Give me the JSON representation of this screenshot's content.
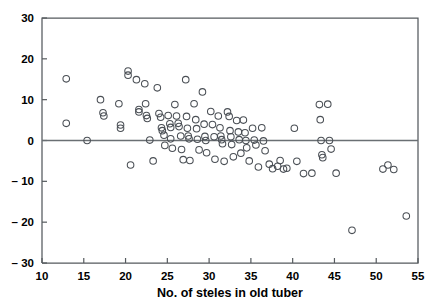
{
  "chart_data": {
    "type": "scatter",
    "title": "",
    "xlabel": "No. of steles in old tuber",
    "ylabel": "",
    "xlim": [
      10,
      55
    ],
    "ylim": [
      -30,
      30
    ],
    "xticks": [
      10,
      15,
      20,
      25,
      30,
      35,
      40,
      45,
      50,
      55
    ],
    "yticks": [
      30,
      20,
      10,
      0,
      -10,
      -20,
      -30
    ],
    "xticklabels": [
      "10",
      "15",
      "20",
      "25",
      "30",
      "35",
      "40",
      "45",
      "50",
      "55"
    ],
    "yticklabels": [
      "30",
      "20",
      "10",
      "0",
      "-10",
      "-20",
      "-30"
    ],
    "grid": false,
    "legend": null,
    "marker": "open-circle",
    "reference_lines": [
      {
        "axis": "horizontal",
        "value": 0
      }
    ],
    "points": [
      [
        12.9,
        15.1
      ],
      [
        12.9,
        4.2
      ],
      [
        15.4,
        0.0
      ],
      [
        17.0,
        10.0
      ],
      [
        17.3,
        6.8
      ],
      [
        17.4,
        6.0
      ],
      [
        19.2,
        9.0
      ],
      [
        19.4,
        3.8
      ],
      [
        19.4,
        3.0
      ],
      [
        20.3,
        17.0
      ],
      [
        20.3,
        16.0
      ],
      [
        20.6,
        -6.0
      ],
      [
        21.3,
        14.9
      ],
      [
        21.6,
        7.6
      ],
      [
        21.6,
        7.0
      ],
      [
        22.3,
        13.9
      ],
      [
        22.4,
        9.0
      ],
      [
        22.5,
        6.1
      ],
      [
        22.6,
        5.4
      ],
      [
        22.9,
        0.1
      ],
      [
        23.3,
        -5.0
      ],
      [
        23.8,
        12.9
      ],
      [
        24.0,
        6.6
      ],
      [
        24.2,
        5.7
      ],
      [
        24.3,
        3.1
      ],
      [
        24.4,
        2.4
      ],
      [
        24.6,
        1.3
      ],
      [
        24.7,
        -1.2
      ],
      [
        25.1,
        6.1
      ],
      [
        25.3,
        4.1
      ],
      [
        25.4,
        3.2
      ],
      [
        25.4,
        0.4
      ],
      [
        25.6,
        -1.9
      ],
      [
        25.9,
        8.8
      ],
      [
        26.1,
        6.0
      ],
      [
        26.3,
        4.2
      ],
      [
        26.4,
        3.4
      ],
      [
        26.6,
        1.1
      ],
      [
        26.7,
        -2.2
      ],
      [
        26.9,
        -4.7
      ],
      [
        27.2,
        14.9
      ],
      [
        27.3,
        5.9
      ],
      [
        27.4,
        3.0
      ],
      [
        27.5,
        1.1
      ],
      [
        27.6,
        0.4
      ],
      [
        27.7,
        -4.9
      ],
      [
        28.2,
        9.0
      ],
      [
        28.4,
        5.1
      ],
      [
        28.5,
        2.9
      ],
      [
        28.6,
        0.3
      ],
      [
        28.8,
        -2.3
      ],
      [
        29.2,
        11.9
      ],
      [
        29.4,
        4.0
      ],
      [
        29.5,
        1.0
      ],
      [
        29.6,
        0.0
      ],
      [
        29.7,
        -3.0
      ],
      [
        30.2,
        7.1
      ],
      [
        30.4,
        3.9
      ],
      [
        30.6,
        0.9
      ],
      [
        30.7,
        -4.6
      ],
      [
        31.1,
        6.0
      ],
      [
        31.3,
        3.1
      ],
      [
        31.4,
        1.1
      ],
      [
        31.5,
        0.2
      ],
      [
        31.6,
        -0.8
      ],
      [
        31.8,
        -5.1
      ],
      [
        32.2,
        7.0
      ],
      [
        32.4,
        5.9
      ],
      [
        32.5,
        2.4
      ],
      [
        32.6,
        0.9
      ],
      [
        32.7,
        -1.0
      ],
      [
        32.9,
        -4.0
      ],
      [
        33.3,
        4.9
      ],
      [
        33.5,
        2.1
      ],
      [
        33.6,
        0.2
      ],
      [
        33.8,
        -3.1
      ],
      [
        34.1,
        5.0
      ],
      [
        34.3,
        1.9
      ],
      [
        34.4,
        0.0
      ],
      [
        34.5,
        -1.8
      ],
      [
        34.8,
        -5.0
      ],
      [
        35.2,
        3.0
      ],
      [
        35.4,
        0.1
      ],
      [
        35.6,
        -1.1
      ],
      [
        35.9,
        -6.5
      ],
      [
        36.3,
        3.1
      ],
      [
        36.5,
        -0.1
      ],
      [
        36.7,
        -2.5
      ],
      [
        37.2,
        -5.8
      ],
      [
        37.6,
        -6.9
      ],
      [
        38.2,
        -6.3
      ],
      [
        38.5,
        -4.9
      ],
      [
        38.9,
        -7.0
      ],
      [
        39.3,
        -6.8
      ],
      [
        40.2,
        3.0
      ],
      [
        40.5,
        -5.1
      ],
      [
        41.3,
        -8.1
      ],
      [
        42.3,
        -8.0
      ],
      [
        43.2,
        8.8
      ],
      [
        43.3,
        5.1
      ],
      [
        43.4,
        0.0
      ],
      [
        43.5,
        -3.5
      ],
      [
        43.6,
        -4.2
      ],
      [
        44.2,
        8.9
      ],
      [
        44.4,
        0.0
      ],
      [
        44.6,
        -2.1
      ],
      [
        45.2,
        -8.0
      ],
      [
        47.1,
        -22.0
      ],
      [
        50.8,
        -7.0
      ],
      [
        51.4,
        -6.0
      ],
      [
        52.1,
        -7.1
      ],
      [
        53.6,
        -18.5
      ]
    ]
  },
  "axis": {
    "x_label": "No. of steles in old tuber",
    "zero_reference": "0"
  },
  "colors": {
    "marker_stroke": "#4a4f55",
    "axis": "#555a5e",
    "background": "#ffffff",
    "text": "#000000"
  }
}
